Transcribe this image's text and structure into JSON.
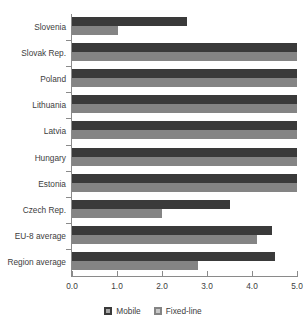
{
  "chart_data": {
    "type": "bar",
    "orientation": "horizontal",
    "title": "",
    "subtitle": "",
    "xlabel": "",
    "ylabel": "",
    "xlim": [
      0.0,
      5.0
    ],
    "xticks": [
      "0.0",
      "1.0",
      "2.0",
      "3.0",
      "4.0",
      "5.0"
    ],
    "xtick_values": [
      0.0,
      1.0,
      2.0,
      3.0,
      4.0,
      5.0
    ],
    "grid": false,
    "legend_position": "bottom-center",
    "categories": [
      "Slovenia",
      "Slovak Rep.",
      "Poland",
      "Lithuania",
      "Latvia",
      "Hungary",
      "Estonia",
      "Czech Rep.",
      "EU-8 average",
      "Region average"
    ],
    "series": [
      {
        "name": "Mobile",
        "color": "#3a3a3a",
        "values": [
          2.55,
          5.0,
          5.0,
          5.0,
          5.0,
          5.0,
          5.0,
          3.5,
          4.45,
          4.5
        ]
      },
      {
        "name": "Fixed-line",
        "color": "#848484",
        "values": [
          1.02,
          5.0,
          5.0,
          5.0,
          5.0,
          5.0,
          5.0,
          2.0,
          4.1,
          2.8
        ]
      }
    ]
  },
  "legend": {
    "entries": [
      {
        "label": "Mobile",
        "swatch": "mobile-swatch"
      },
      {
        "label": "Fixed-line",
        "swatch": "fixed-line-swatch"
      }
    ]
  },
  "colors": {
    "mobile": "#3a3a3a",
    "fixed_line": "#848484",
    "axis": "#8a8a8a",
    "text": "#3d3d3d",
    "background": "#ffffff"
  }
}
